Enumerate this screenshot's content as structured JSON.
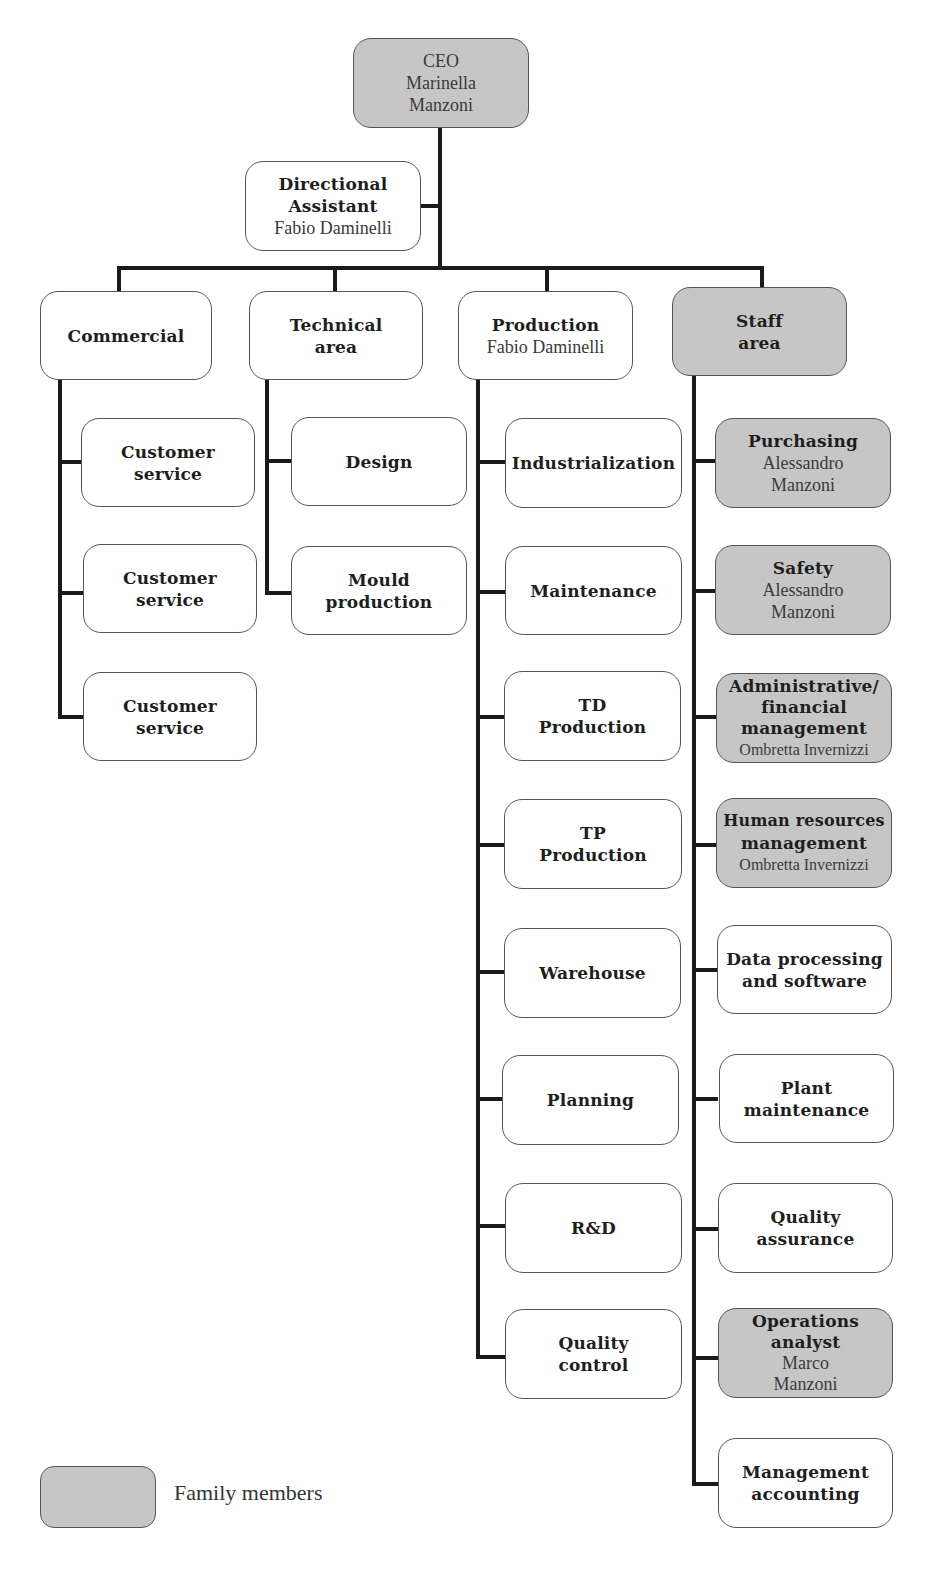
{
  "chart": {
    "ceo": {
      "title": "CEO",
      "name_line1": "Marinella",
      "name_line2": "Manzoni",
      "family": true
    },
    "assistant": {
      "title_line1": "Directional",
      "title_line2": "Assistant",
      "name": "Fabio Daminelli",
      "family": false
    },
    "areas": {
      "commercial": {
        "title": "Commercial",
        "family": false,
        "children": [
          {
            "line1": "Customer",
            "line2": "service"
          },
          {
            "line1": "Customer",
            "line2": "service"
          },
          {
            "line1": "Customer",
            "line2": "service"
          }
        ]
      },
      "technical": {
        "title_line1": "Technical",
        "title_line2": "area",
        "family": false,
        "children": [
          {
            "line1": "Design"
          },
          {
            "line1": "Mould",
            "line2": "production"
          }
        ]
      },
      "production": {
        "title": "Production",
        "name": "Fabio Daminelli",
        "family": false,
        "children": [
          {
            "line1": "Industrialization"
          },
          {
            "line1": "Maintenance"
          },
          {
            "line1": "TD",
            "line2": "Production"
          },
          {
            "line1": "TP",
            "line2": "Production"
          },
          {
            "line1": "Warehouse"
          },
          {
            "line1": "Planning"
          },
          {
            "line1": "R&D"
          },
          {
            "line1": "Quality",
            "line2": "control"
          }
        ]
      },
      "staff": {
        "title_line1": "Staff",
        "title_line2": "area",
        "family": true,
        "children": [
          {
            "title": "Purchasing",
            "name_line1": "Alessandro",
            "name_line2": "Manzoni",
            "family": true
          },
          {
            "title": "Safety",
            "name_line1": "Alessandro",
            "name_line2": "Manzoni",
            "family": true
          },
          {
            "title_line1": "Administrative/",
            "title_line2": "financial",
            "title_line3": "management",
            "name": "Ombretta Invernizzi",
            "family": true
          },
          {
            "title_line1": "Human resources",
            "title_line2": "management",
            "name": "Ombretta Invernizzi",
            "family": true
          },
          {
            "title_line1": "Data processing",
            "title_line2": "and software",
            "family": false
          },
          {
            "title_line1": "Plant",
            "title_line2": "maintenance",
            "family": false
          },
          {
            "title_line1": "Quality",
            "title_line2": "assurance",
            "family": false
          },
          {
            "title_line1": "Operations",
            "title_line2": "analyst",
            "name_line1": "Marco",
            "name_line2": "Manzoni",
            "family": true
          },
          {
            "title_line1": "Management",
            "title_line2": "accounting",
            "family": false
          }
        ]
      }
    }
  },
  "legend": {
    "label": "Family members",
    "color": "#c6c6c6"
  },
  "colors": {
    "family_fill": "#c6c6c6",
    "box_fill": "#ffffff",
    "connector": "#1a1a1a",
    "border": "#555555"
  }
}
